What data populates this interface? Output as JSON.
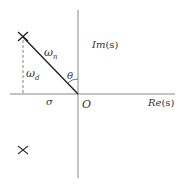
{
  "diagram": {
    "type": "s-plane pole diagram",
    "axes": {
      "imaginary_label_prefix": "Im",
      "imaginary_label_suffix": "(s)",
      "real_label_prefix": "Re",
      "real_label_suffix": "(s)",
      "origin_label": "O"
    },
    "labels": {
      "omega_n": "ω",
      "omega_n_sub": "n",
      "omega_d": "ω",
      "omega_d_sub": "d",
      "theta": "θ",
      "sigma": "σ"
    },
    "poles": [
      {
        "name": "upper-pole",
        "marker": "×"
      },
      {
        "name": "lower-pole",
        "marker": "×"
      }
    ],
    "colors": {
      "axis": "#888888",
      "line": "#222222",
      "text": "#333333"
    }
  }
}
